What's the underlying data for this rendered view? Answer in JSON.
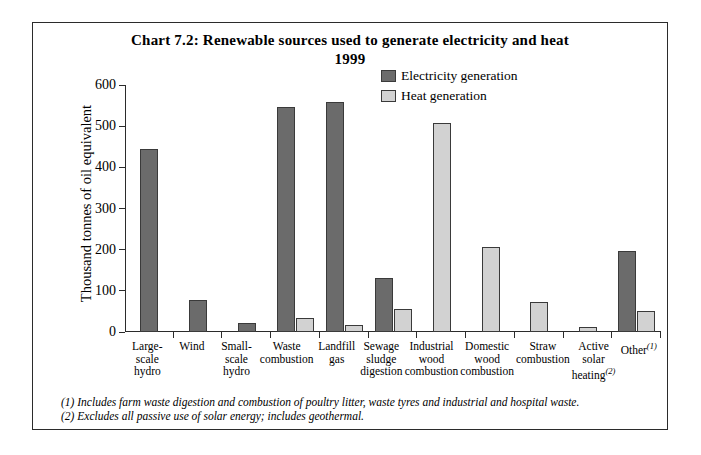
{
  "chart_data": {
    "type": "bar",
    "title": "Chart 7.2:  Renewable sources used to generate electricity and heat",
    "subtitle": "1999",
    "xlabel": "",
    "ylabel": "Thousand tonnes of oil equivalent",
    "ylim": [
      0,
      600
    ],
    "yticks": [
      600,
      500,
      400,
      300,
      200,
      100,
      0
    ],
    "grid": false,
    "legend_position": "top-right",
    "categories": [
      "Large-scale hydro",
      "Wind",
      "Small-scale hydro",
      "Waste combustion",
      "Landfill gas",
      "Sewage sludge digestion",
      "Industrial wood combustion",
      "Domestic wood combustion",
      "Straw combustion",
      "Active solar heating",
      "Other"
    ],
    "series": [
      {
        "name": "Electricity generation",
        "color": "#6b6b6b",
        "values": [
          445,
          78,
          22,
          547,
          559,
          131,
          0,
          0,
          0,
          0,
          196
        ]
      },
      {
        "name": "Heat generation",
        "color": "#d2d2d2",
        "values": [
          0,
          0,
          0,
          33,
          16,
          57,
          508,
          207,
          74,
          13,
          51
        ]
      }
    ]
  },
  "axis": {
    "y_title": "Thousand tonnes of oil equivalent"
  },
  "x_labels": [
    {
      "lines": [
        "Large-",
        "scale",
        "hydro"
      ],
      "sup": ""
    },
    {
      "lines": [
        "Wind"
      ],
      "sup": ""
    },
    {
      "lines": [
        "Small-",
        "scale",
        "hydro"
      ],
      "sup": ""
    },
    {
      "lines": [
        "Waste",
        "combustion"
      ],
      "sup": ""
    },
    {
      "lines": [
        "Landfill",
        "gas"
      ],
      "sup": ""
    },
    {
      "lines": [
        "Sewage",
        "sludge",
        "digestion"
      ],
      "sup": ""
    },
    {
      "lines": [
        "Industrial",
        "wood",
        "combustion"
      ],
      "sup": ""
    },
    {
      "lines": [
        "Domestic",
        "wood",
        "combustion"
      ],
      "sup": ""
    },
    {
      "lines": [
        "Straw",
        "combustion"
      ],
      "sup": ""
    },
    {
      "lines": [
        "Active",
        "solar",
        "heating"
      ],
      "sup": "(2)"
    },
    {
      "lines": [
        "Other"
      ],
      "sup": "(1)"
    }
  ],
  "legend": {
    "items": [
      {
        "label": "Electricity generation",
        "color": "#6b6b6b"
      },
      {
        "label": "Heat generation",
        "color": "#d2d2d2"
      }
    ]
  },
  "footnotes": [
    "(1) Includes farm waste digestion and combustion of poultry litter, waste tyres and industrial and hospital waste.",
    "(2) Excludes all passive use of solar energy; includes geothermal."
  ]
}
